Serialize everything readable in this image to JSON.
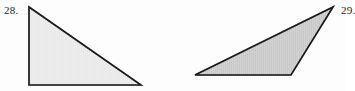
{
  "page": {
    "background_color": "#fdfdfd",
    "width": 346,
    "height": 91
  },
  "figures": [
    {
      "id": "28",
      "label": "28.",
      "shape": "triangle",
      "shape_subtype": "right triangle",
      "fill_color": "#e9e9e9",
      "stroke_color": "#1a1a1a",
      "stroke_width": 1.6,
      "points": "29,7 141,85 29,85",
      "vertices": [
        {
          "name": "top-left apex",
          "x": 29,
          "y": 7
        },
        {
          "name": "bottom-right",
          "x": 141,
          "y": 85
        },
        {
          "name": "bottom-left right-angle",
          "x": 29,
          "y": 85
        }
      ]
    },
    {
      "id": "29",
      "label": "29.",
      "shape": "triangle",
      "shape_subtype": "obtuse scalene triangle",
      "fill_color": "#c9c9c9",
      "stroke_color": "#1a1a1a",
      "stroke_width": 1.6,
      "points": "333,7 291,75 195,75",
      "vertices": [
        {
          "name": "top-right apex",
          "x": 333,
          "y": 7
        },
        {
          "name": "bottom-right",
          "x": 291,
          "y": 75
        },
        {
          "name": "bottom-left",
          "x": 195,
          "y": 75
        }
      ]
    }
  ]
}
